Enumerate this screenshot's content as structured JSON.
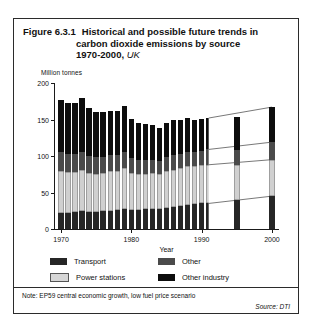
{
  "figure": {
    "number": "Figure 6.3.1",
    "title_line1": "Historical and possible future trends in",
    "title_line2": "carbon dioxide emissions by source",
    "title_line3_years": "1970-2000,",
    "title_line3_region": "UK",
    "note": "Note: EP59 central economic growth, low fuel price scenario",
    "source": "Source: DTI"
  },
  "legend": {
    "items": [
      {
        "label": "Transport",
        "key": "transport",
        "color": "#262626"
      },
      {
        "label": "Other",
        "key": "other",
        "color": "#4a4a4a"
      },
      {
        "label": "Power stations",
        "key": "power",
        "color": "#d6d6d6"
      },
      {
        "label": "Other industry",
        "key": "industry",
        "color": "#0d0d0d"
      }
    ]
  },
  "chart_data": {
    "type": "bar",
    "stacked": true,
    "title": "Historical and possible future trends in carbon dioxide emissions by source 1970-2000, UK",
    "xlabel": "Year",
    "ylabel": "Million tonnes",
    "ylim": [
      0,
      200
    ],
    "yticks": [
      0,
      50,
      100,
      150,
      200
    ],
    "ytick_labels": [
      "0",
      "50",
      "100",
      "150",
      "200"
    ],
    "xlim": [
      1969,
      2001
    ],
    "xticks": [
      1970,
      1980,
      1990,
      2000
    ],
    "xtick_labels": [
      "1970",
      "1980",
      "1990",
      "2000"
    ],
    "grid": false,
    "legend_position": "below-axes",
    "series": [
      {
        "name": "Transport",
        "order": 1
      },
      {
        "name": "Power stations",
        "order": 2
      },
      {
        "name": "Other",
        "order": 3
      },
      {
        "name": "Other industry",
        "order": 4
      }
    ],
    "historical": {
      "years": [
        1970,
        1971,
        1972,
        1973,
        1974,
        1975,
        1976,
        1977,
        1978,
        1979,
        1980,
        1981,
        1982,
        1983,
        1984,
        1985,
        1986,
        1987,
        1988,
        1989,
        1990,
        1991
      ],
      "transport": [
        22,
        22,
        23,
        24,
        23,
        23,
        24,
        25,
        26,
        27,
        26,
        26,
        27,
        27,
        28,
        29,
        30,
        31,
        33,
        34,
        35,
        35
      ],
      "power_stations": [
        57,
        56,
        55,
        57,
        54,
        53,
        53,
        54,
        54,
        56,
        51,
        50,
        49,
        50,
        47,
        50,
        51,
        52,
        53,
        52,
        52,
        53
      ],
      "other": [
        26,
        25,
        25,
        25,
        23,
        22,
        22,
        22,
        22,
        23,
        20,
        19,
        19,
        18,
        18,
        20,
        21,
        20,
        20,
        20,
        20,
        21
      ],
      "other_industry": [
        72,
        70,
        70,
        73,
        66,
        62,
        61,
        60,
        59,
        62,
        54,
        50,
        49,
        48,
        45,
        46,
        47,
        46,
        46,
        44,
        44,
        43
      ],
      "totals": [
        177,
        173,
        173,
        179,
        166,
        160,
        160,
        161,
        161,
        168,
        151,
        145,
        144,
        143,
        138,
        145,
        149,
        149,
        152,
        150,
        151,
        152
      ]
    },
    "projection": {
      "start_year": 1991,
      "end_year": 2000,
      "marker_years": [
        1995,
        2000
      ],
      "bars": [
        {
          "year": 1995,
          "transport": 40,
          "power_stations": 47,
          "other": 21,
          "other_industry": 45,
          "total": 153
        },
        {
          "year": 2000,
          "transport": 45,
          "power_stations": 50,
          "other": 24,
          "other_industry": 48,
          "total": 167
        }
      ],
      "band_boundaries_1991": {
        "b1": 35,
        "b2": 88,
        "b3": 109,
        "b4": 152
      },
      "band_boundaries_2000": {
        "b1": 45,
        "b2": 95,
        "b3": 119,
        "b4": 167
      }
    }
  }
}
